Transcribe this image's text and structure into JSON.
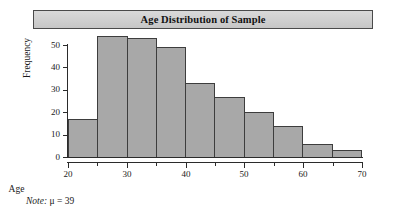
{
  "figure": {
    "title": "Age Distribution of Sample",
    "note_label": "Note:",
    "note_value": "μ = 39"
  },
  "colors": {
    "bar_fill": "#a8a8a8",
    "bar_stroke": "#3d3d3d",
    "banner_fill": "#d0d0d0",
    "banner_stroke": "#4a4a4a",
    "axis": "#2b2b2b",
    "text": "#1a1a1a",
    "background": "#ffffff"
  },
  "chart_data": {
    "type": "bar",
    "title": "Age Distribution of Sample",
    "subtitle": "",
    "xlabel": "Age",
    "ylabel": "Frequency",
    "bin_width": 5,
    "bin_edges": [
      20,
      25,
      30,
      35,
      40,
      45,
      50,
      55,
      60,
      65,
      70
    ],
    "categories": [
      "20-25",
      "25-30",
      "30-35",
      "35-40",
      "40-45",
      "45-50",
      "50-55",
      "55-60",
      "60-65",
      "65-70"
    ],
    "values": [
      17,
      54,
      53,
      49,
      33,
      27,
      20,
      14,
      6,
      3
    ],
    "xlim": [
      20,
      70
    ],
    "ylim": [
      0,
      50
    ],
    "xticks": [
      20,
      30,
      40,
      50,
      60,
      70
    ],
    "xticks_minor": [
      25,
      35,
      45,
      55,
      65
    ],
    "xtick_labels": [
      "20",
      "30",
      "40",
      "50",
      "60",
      "70"
    ],
    "yticks": [
      0,
      10,
      20,
      30,
      40,
      50
    ],
    "ytick_labels": [
      "0",
      "10",
      "20",
      "30",
      "40",
      "50"
    ],
    "grid": false,
    "legend": false,
    "annotations": [
      "Note: μ = 39"
    ],
    "mean": 39
  }
}
